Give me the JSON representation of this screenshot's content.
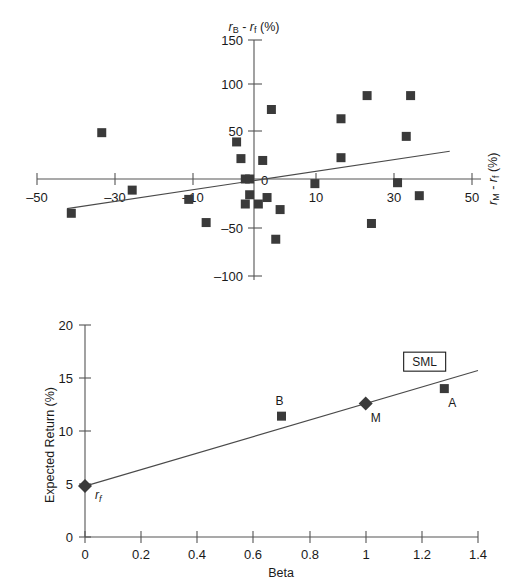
{
  "page": {
    "clipped_header": "",
    "background": "#ffffff",
    "marker_color": "#3a3a3a",
    "line_color": "#4a4a4a",
    "axis_color": "#555555"
  },
  "chart_data": [
    {
      "id": "characteristic-line",
      "type": "scatter",
      "title": "",
      "xlabel": "rₘ - rf (%)",
      "ylabel": "rʙ - rf (%)",
      "xlabel_plain": "rM - rf (%)",
      "ylabel_plain": "rB - rf (%)",
      "xlim": [
        -50,
        50
      ],
      "ylim": [
        -100,
        150
      ],
      "xticks": [
        -50,
        -30,
        -10,
        10,
        30,
        50
      ],
      "xtick_labels": [
        "–50",
        "–30",
        "–10",
        "10",
        "30",
        "50"
      ],
      "yticks": [
        -100,
        -50,
        0,
        50,
        100,
        150
      ],
      "ytick_labels": [
        "–100",
        "–50",
        "0",
        "50",
        "100",
        "150"
      ],
      "grid": false,
      "legend": "none",
      "axes_style": "crossed-at-origin",
      "x": [
        -42,
        -35,
        -28,
        -15,
        -11,
        -4,
        -3,
        -2,
        -1,
        -1,
        -2,
        0,
        1,
        2,
        3,
        4,
        5,
        6,
        14,
        20,
        20,
        26,
        27,
        33,
        35,
        36,
        38,
        40
      ],
      "y": [
        -37,
        50,
        -12,
        -22,
        -47,
        40,
        22,
        0,
        0,
        -17,
        -27,
        -2,
        -27,
        20,
        -20,
        75,
        -65,
        -33,
        -5,
        23,
        65,
        90,
        -48,
        -4,
        46,
        90,
        -18,
        0
      ],
      "points": [
        {
          "x": -42,
          "y": -37
        },
        {
          "x": -35,
          "y": 50
        },
        {
          "x": -28,
          "y": -12
        },
        {
          "x": -15,
          "y": -22
        },
        {
          "x": -11,
          "y": -47
        },
        {
          "x": -4,
          "y": 40
        },
        {
          "x": -3,
          "y": 22
        },
        {
          "x": -2,
          "y": 0
        },
        {
          "x": -1,
          "y": 0
        },
        {
          "x": -1,
          "y": -17
        },
        {
          "x": -2,
          "y": -27
        },
        {
          "x": 1,
          "y": -27
        },
        {
          "x": 2,
          "y": 20
        },
        {
          "x": 3,
          "y": -20
        },
        {
          "x": 4,
          "y": 75
        },
        {
          "x": 5,
          "y": -65
        },
        {
          "x": 6,
          "y": -33
        },
        {
          "x": 14,
          "y": -5
        },
        {
          "x": 20,
          "y": 23
        },
        {
          "x": 20,
          "y": 65
        },
        {
          "x": 26,
          "y": 90
        },
        {
          "x": 27,
          "y": -48
        },
        {
          "x": 33,
          "y": -4
        },
        {
          "x": 35,
          "y": 46
        },
        {
          "x": 36,
          "y": 90
        },
        {
          "x": 38,
          "y": -18
        }
      ],
      "fit_line": {
        "name": "characteristic line",
        "x0": -43,
        "y0": -32,
        "x1": 45,
        "y1": 30,
        "slope": 0.705,
        "intercept": -1.7
      }
    },
    {
      "id": "security-market-line",
      "type": "scatter",
      "title": "",
      "xlabel": "Beta",
      "ylabel": "Expected Return (%)",
      "xlim": [
        0,
        1.4
      ],
      "ylim": [
        0,
        20
      ],
      "xticks": [
        0,
        0.2,
        0.4,
        0.6,
        0.8,
        1,
        1.2,
        1.4
      ],
      "xtick_labels": [
        "0",
        "0.2",
        "0.4",
        "0.6",
        "0.8",
        "1",
        "1.2",
        "1.4"
      ],
      "yticks": [
        0,
        5,
        10,
        15,
        20
      ],
      "ytick_labels": [
        "0",
        "5",
        "10",
        "15",
        "20"
      ],
      "grid": false,
      "legend": "SML",
      "annotations": [
        {
          "label": "SML",
          "boxed": true,
          "x": 1.21,
          "y": 16.4
        }
      ],
      "points": [
        {
          "label": "rf",
          "label_plain": "rf",
          "x": 0,
          "y": 4.8,
          "marker": "diamond"
        },
        {
          "label": "B",
          "x": 0.7,
          "y": 11.4,
          "marker": "square"
        },
        {
          "label": "M",
          "x": 1.0,
          "y": 12.6,
          "marker": "diamond"
        },
        {
          "label": "A",
          "x": 1.28,
          "y": 14.0,
          "marker": "square"
        }
      ],
      "sml_line": {
        "x0": 0,
        "y0": 4.8,
        "x1": 1.4,
        "y1": 15.7,
        "slope": 7.8,
        "intercept": 4.8
      }
    }
  ]
}
